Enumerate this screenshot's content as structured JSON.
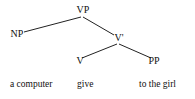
{
  "tree": {
    "nodes": [
      {
        "id": "VP",
        "label": "VP",
        "x": 83,
        "y": 13
      },
      {
        "id": "NP",
        "label": "NP",
        "x": 17,
        "y": 37
      },
      {
        "id": "Vbar",
        "label": "V'",
        "x": 119,
        "y": 41
      },
      {
        "id": "V",
        "label": "V",
        "x": 80,
        "y": 64
      },
      {
        "id": "PP",
        "label": "PP",
        "x": 154,
        "y": 64
      }
    ],
    "edges": [
      {
        "from": "VP",
        "to": "NP",
        "x1": 81,
        "y1": 17,
        "x2": 24,
        "y2": 32
      },
      {
        "from": "VP",
        "to": "Vbar",
        "x1": 83,
        "y1": 17,
        "x2": 114,
        "y2": 35
      },
      {
        "from": "Vbar",
        "to": "V",
        "x1": 117,
        "y1": 44,
        "x2": 82,
        "y2": 58
      },
      {
        "from": "Vbar",
        "to": "PP",
        "x1": 119,
        "y1": 44,
        "x2": 151,
        "y2": 58
      }
    ],
    "words": [
      {
        "text": "a computer",
        "x": 10,
        "y": 87
      },
      {
        "text": "give",
        "x": 77,
        "y": 87
      },
      {
        "text": "to the girl",
        "x": 139,
        "y": 87
      }
    ]
  }
}
